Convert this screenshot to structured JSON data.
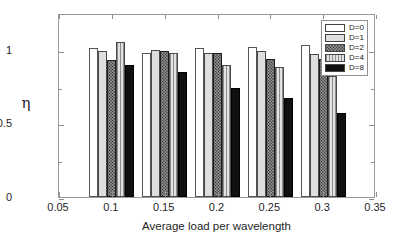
{
  "chart_data": {
    "type": "bar",
    "title": "",
    "xlabel": "Average load per wavelength",
    "ylabel": "η",
    "categories": [
      "0.1",
      "0.15",
      "0.2",
      "0.25",
      "0.3"
    ],
    "x": [
      0.1,
      0.15,
      0.2,
      0.25,
      0.3
    ],
    "xlim": [
      0.05,
      0.35
    ],
    "ylim": [
      0,
      1.25
    ],
    "xticks": [
      "0.05",
      "0.1",
      "0.15",
      "0.2",
      "0.25",
      "0.3",
      "0.35"
    ],
    "yticks": [
      "0",
      "0.5",
      "1"
    ],
    "yticks_minor": [
      0.25,
      0.75
    ],
    "grid": false,
    "legend_position": "top-right",
    "series": [
      {
        "name": "D=0",
        "color": "#ffffff",
        "pattern": "solid-white",
        "values": [
          1.01,
          0.98,
          1.01,
          1.02,
          1.03
        ]
      },
      {
        "name": "D=1",
        "color": "#dededd",
        "pattern": "solid-lightgray",
        "values": [
          0.99,
          1.0,
          0.98,
          0.99,
          0.97
        ]
      },
      {
        "name": "D=2",
        "color": "#2e2e2e",
        "pattern": "dark-crosshatch",
        "values": [
          0.93,
          0.99,
          0.98,
          0.94,
          0.94
        ]
      },
      {
        "name": "D=4",
        "color": "#b9b9b8",
        "pattern": "gray-vertical",
        "values": [
          1.05,
          0.98,
          0.9,
          0.88,
          0.82
        ]
      },
      {
        "name": "D=8",
        "color": "#101010",
        "pattern": "solid-black",
        "values": [
          0.9,
          0.85,
          0.74,
          0.67,
          0.57
        ]
      }
    ]
  },
  "axes": {
    "ylabel": "η",
    "xlabel": "Average load per wavelength"
  }
}
